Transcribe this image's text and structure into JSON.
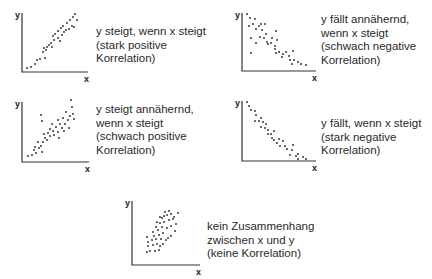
{
  "panels": [
    {
      "id": "strong-positive",
      "origin": [
        0,
        0
      ],
      "axes": {
        "x0": 22,
        "ytop": 13,
        "ybottom": 72,
        "xright": 88
      },
      "labels": {
        "y": "y",
        "x": "x"
      },
      "caption_pos": [
        96,
        25
      ],
      "caption": [
        "y steigt, wenn x steigt",
        "(stark positive",
        "Korrelation)"
      ],
      "points": [
        [
          27,
          68
        ],
        [
          31,
          67
        ],
        [
          35,
          64
        ],
        [
          37,
          60
        ],
        [
          40,
          59
        ],
        [
          45,
          58
        ],
        [
          43,
          52
        ],
        [
          46,
          50
        ],
        [
          44,
          48
        ],
        [
          47,
          47
        ],
        [
          49,
          45
        ],
        [
          52,
          47
        ],
        [
          51,
          43
        ],
        [
          54,
          40
        ],
        [
          53,
          36
        ],
        [
          55,
          34
        ],
        [
          58,
          38
        ],
        [
          58,
          31
        ],
        [
          60,
          41
        ],
        [
          62,
          35
        ],
        [
          61,
          28
        ],
        [
          64,
          32
        ],
        [
          63,
          26
        ],
        [
          66,
          30
        ],
        [
          67,
          23
        ],
        [
          69,
          29
        ],
        [
          70,
          20
        ],
        [
          72,
          26
        ],
        [
          73,
          17
        ],
        [
          75,
          14
        ],
        [
          77,
          20
        ],
        [
          74,
          27
        ]
      ]
    },
    {
      "id": "weak-negative",
      "origin": [
        0,
        0
      ],
      "axes": {
        "x0": 242,
        "ytop": 13,
        "ybottom": 71,
        "xright": 316
      },
      "labels": {
        "y": "y",
        "x": "x"
      },
      "caption_pos": [
        321,
        13
      ],
      "caption": [
        "y fällt annähernd,",
        "wenn x steigt",
        "(schwach negative",
        "Korrelation)"
      ],
      "points": [
        [
          247,
          14
        ],
        [
          250,
          18
        ],
        [
          255,
          19
        ],
        [
          249,
          26
        ],
        [
          253,
          24
        ],
        [
          256,
          29
        ],
        [
          259,
          26
        ],
        [
          261,
          24
        ],
        [
          265,
          24
        ],
        [
          262,
          30
        ],
        [
          266,
          34
        ],
        [
          264,
          38
        ],
        [
          267,
          42
        ],
        [
          260,
          37
        ],
        [
          251,
          38
        ],
        [
          256,
          43
        ],
        [
          272,
          38
        ],
        [
          271,
          43
        ],
        [
          276,
          31
        ],
        [
          277,
          40
        ],
        [
          275,
          46
        ],
        [
          268,
          44
        ],
        [
          275,
          49
        ],
        [
          276,
          53
        ],
        [
          279,
          52
        ],
        [
          283,
          54
        ],
        [
          286,
          52
        ],
        [
          282,
          57
        ],
        [
          289,
          56
        ],
        [
          293,
          51
        ],
        [
          290,
          60
        ],
        [
          294,
          60
        ],
        [
          292,
          64
        ],
        [
          298,
          62
        ],
        [
          301,
          64
        ],
        [
          306,
          65
        ],
        [
          251,
          53
        ]
      ]
    },
    {
      "id": "weak-positive",
      "origin": [
        0,
        0
      ],
      "axes": {
        "x0": 22,
        "ytop": 102,
        "ybottom": 162,
        "xright": 89
      },
      "labels": {
        "y": "y",
        "x": "x"
      },
      "caption_pos": [
        96,
        103
      ],
      "caption": [
        "y steigt annähernd,",
        "wenn x steigt",
        "(schwach positive",
        "Korrelation)"
      ],
      "points": [
        [
          28,
          156
        ],
        [
          32,
          155
        ],
        [
          34,
          150
        ],
        [
          36,
          153
        ],
        [
          35,
          147
        ],
        [
          39,
          148
        ],
        [
          41,
          146
        ],
        [
          42,
          152
        ],
        [
          38,
          142
        ],
        [
          43,
          142
        ],
        [
          45,
          138
        ],
        [
          47,
          140
        ],
        [
          44,
          134
        ],
        [
          48,
          133
        ],
        [
          50,
          136
        ],
        [
          50,
          129
        ],
        [
          53,
          131
        ],
        [
          52,
          124
        ],
        [
          56,
          127
        ],
        [
          54,
          135
        ],
        [
          58,
          132
        ],
        [
          58,
          120
        ],
        [
          60,
          124
        ],
        [
          59,
          138
        ],
        [
          62,
          128
        ],
        [
          63,
          118
        ],
        [
          64,
          131
        ],
        [
          65,
          124
        ],
        [
          66,
          112
        ],
        [
          68,
          120
        ],
        [
          69,
          128
        ],
        [
          70,
          116
        ],
        [
          72,
          107
        ],
        [
          73,
          114
        ],
        [
          74,
          119
        ],
        [
          71,
          100
        ],
        [
          42,
          121
        ],
        [
          41,
          115
        ]
      ]
    },
    {
      "id": "strong-negative",
      "origin": [
        0,
        0
      ],
      "axes": {
        "x0": 242,
        "ytop": 101,
        "ybottom": 161,
        "xright": 316
      },
      "labels": {
        "y": "y",
        "x": "x"
      },
      "caption_pos": [
        321,
        117
      ],
      "caption": [
        "y fällt, wenn x steigt",
        "(stark negative",
        "Korrelation)"
      ],
      "points": [
        [
          247,
          102
        ],
        [
          249,
          106
        ],
        [
          251,
          110
        ],
        [
          255,
          111
        ],
        [
          256,
          115
        ],
        [
          255,
          121
        ],
        [
          261,
          118
        ],
        [
          259,
          121
        ],
        [
          263,
          122
        ],
        [
          266,
          124
        ],
        [
          261,
          127
        ],
        [
          265,
          128
        ],
        [
          268,
          130
        ],
        [
          268,
          134
        ],
        [
          271,
          134
        ],
        [
          274,
          131
        ],
        [
          272,
          138
        ],
        [
          274,
          140
        ],
        [
          279,
          139
        ],
        [
          277,
          143
        ],
        [
          280,
          146
        ],
        [
          285,
          146
        ],
        [
          287,
          149
        ],
        [
          292,
          150
        ],
        [
          290,
          155
        ],
        [
          296,
          156
        ],
        [
          298,
          154
        ],
        [
          298,
          159
        ],
        [
          303,
          157
        ],
        [
          306,
          159
        ],
        [
          293,
          145
        ],
        [
          283,
          141
        ]
      ]
    },
    {
      "id": "no-correlation",
      "origin": [
        0,
        0
      ],
      "axes": {
        "x0": 132,
        "ytop": 201,
        "ybottom": 265,
        "xright": 200
      },
      "labels": {
        "y": "y",
        "x": "x"
      },
      "caption_pos": [
        207,
        220
      ],
      "caption": [
        "kein Zusammenhang",
        "zwischen x und y",
        "(keine Korrelation)"
      ],
      "points": [
        [
          147,
          252
        ],
        [
          150,
          251
        ],
        [
          155,
          251
        ],
        [
          159,
          250
        ],
        [
          148,
          246
        ],
        [
          153,
          245
        ],
        [
          157,
          244
        ],
        [
          160,
          246
        ],
        [
          163,
          244
        ],
        [
          148,
          242
        ],
        [
          152,
          240
        ],
        [
          156,
          239
        ],
        [
          161,
          239
        ],
        [
          166,
          240
        ],
        [
          147,
          237
        ],
        [
          154,
          236
        ],
        [
          159,
          235
        ],
        [
          163,
          233
        ],
        [
          168,
          238
        ],
        [
          171,
          236
        ],
        [
          153,
          232
        ],
        [
          158,
          230
        ],
        [
          162,
          227
        ],
        [
          167,
          228
        ],
        [
          171,
          226
        ],
        [
          175,
          231
        ],
        [
          156,
          227
        ],
        [
          160,
          223
        ],
        [
          164,
          222
        ],
        [
          169,
          220
        ],
        [
          173,
          219
        ],
        [
          176,
          224
        ],
        [
          157,
          222
        ],
        [
          162,
          218
        ],
        [
          167,
          215
        ],
        [
          171,
          214
        ],
        [
          174,
          217
        ],
        [
          165,
          212
        ],
        [
          169,
          211
        ],
        [
          178,
          213
        ],
        [
          164,
          216
        ],
        [
          160,
          217
        ]
      ]
    }
  ],
  "colors": {
    "axis": "#333333",
    "dot": "#2a2a2a",
    "text": "#2a2a2a"
  }
}
